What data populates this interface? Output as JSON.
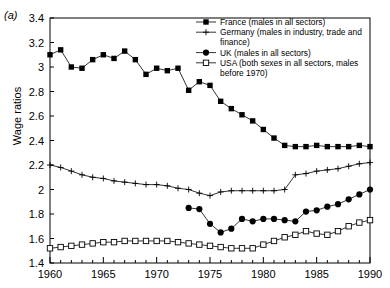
{
  "panel": {
    "label": "(a)"
  },
  "chart_data": {
    "type": "line",
    "title": "",
    "xlabel": "",
    "ylabel": "Wage ratios",
    "xlim": [
      1960,
      1990
    ],
    "ylim": [
      1.4,
      3.4
    ],
    "yticks": [
      1.4,
      1.6,
      1.8,
      2.0,
      2.2,
      2.4,
      2.6,
      2.8,
      3.0,
      3.2,
      3.4
    ],
    "ytick_labels": [
      "1.4",
      "1.6",
      "1.8",
      "2",
      "2.2",
      "2.4",
      "2.6",
      "2.8",
      "3",
      "3.2",
      "3.4"
    ],
    "xticks": [
      1960,
      1965,
      1970,
      1975,
      1980,
      1985,
      1990
    ],
    "xtick_labels": [
      "1960",
      "1965",
      "1970",
      "1975",
      "1980",
      "1985",
      "1990"
    ],
    "x_minor_step": 1,
    "grid": false,
    "legend_position": "top-right",
    "series": [
      {
        "name": "France (males in all sectors)",
        "marker": "filled-square",
        "x": [
          1960,
          1961,
          1962,
          1963,
          1964,
          1965,
          1966,
          1967,
          1968,
          1969,
          1970,
          1971,
          1972,
          1973,
          1974,
          1975,
          1976,
          1977,
          1978,
          1979,
          1980,
          1981,
          1982,
          1983,
          1984,
          1985,
          1986,
          1987,
          1988,
          1989,
          1990
        ],
        "values": [
          3.1,
          3.14,
          3.0,
          2.99,
          3.06,
          3.1,
          3.07,
          3.13,
          3.06,
          2.94,
          2.99,
          2.97,
          2.99,
          2.81,
          2.88,
          2.85,
          2.72,
          2.66,
          2.61,
          2.56,
          2.49,
          2.42,
          2.36,
          2.35,
          2.35,
          2.36,
          2.35,
          2.35,
          2.35,
          2.36,
          2.35
        ]
      },
      {
        "name": "Germany (males in industry, trade and finance)",
        "marker": "plus",
        "x": [
          1960,
          1961,
          1962,
          1963,
          1964,
          1965,
          1966,
          1967,
          1968,
          1969,
          1970,
          1971,
          1972,
          1973,
          1974,
          1975,
          1976,
          1977,
          1978,
          1979,
          1980,
          1981,
          1982,
          1983,
          1984,
          1985,
          1986,
          1987,
          1988,
          1989,
          1990
        ],
        "values": [
          2.2,
          2.18,
          2.15,
          2.12,
          2.1,
          2.09,
          2.07,
          2.06,
          2.05,
          2.04,
          2.04,
          2.03,
          2.01,
          2.0,
          1.97,
          1.95,
          1.98,
          1.99,
          1.99,
          1.99,
          1.99,
          1.99,
          2.0,
          2.12,
          2.13,
          2.15,
          2.16,
          2.17,
          2.19,
          2.21,
          2.22
        ]
      },
      {
        "name": "UK (males in all sectors)",
        "marker": "filled-circle",
        "x": [
          1973,
          1974,
          1975,
          1976,
          1977,
          1978,
          1979,
          1980,
          1981,
          1982,
          1983,
          1984,
          1985,
          1986,
          1987,
          1988,
          1989,
          1990
        ],
        "values": [
          1.85,
          1.84,
          1.72,
          1.65,
          1.68,
          1.76,
          1.74,
          1.76,
          1.76,
          1.75,
          1.74,
          1.82,
          1.83,
          1.86,
          1.88,
          1.92,
          1.96,
          2.0
        ]
      },
      {
        "name": "USA (both sexes in all sectors, males before 1970)",
        "marker": "open-square",
        "x": [
          1960,
          1961,
          1962,
          1963,
          1964,
          1965,
          1966,
          1967,
          1968,
          1969,
          1970,
          1971,
          1972,
          1973,
          1974,
          1975,
          1976,
          1977,
          1978,
          1979,
          1980,
          1981,
          1982,
          1983,
          1984,
          1985,
          1986,
          1987,
          1988,
          1989,
          1990
        ],
        "values": [
          1.52,
          1.53,
          1.54,
          1.55,
          1.56,
          1.57,
          1.57,
          1.58,
          1.58,
          1.58,
          1.58,
          1.58,
          1.57,
          1.56,
          1.55,
          1.54,
          1.53,
          1.52,
          1.52,
          1.52,
          1.55,
          1.58,
          1.61,
          1.63,
          1.66,
          1.64,
          1.63,
          1.66,
          1.7,
          1.73,
          1.75
        ]
      }
    ]
  }
}
